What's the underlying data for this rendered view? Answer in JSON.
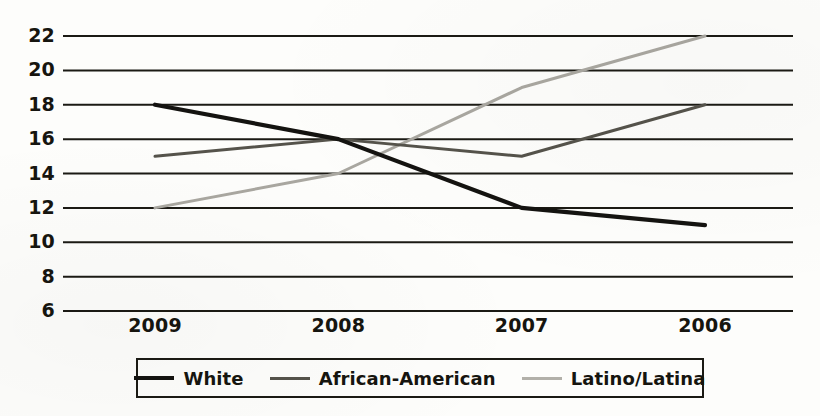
{
  "chart_data": {
    "type": "line",
    "title": "",
    "subtitle": "",
    "xlabel": "",
    "ylabel": "",
    "categories": [
      "2009",
      "2008",
      "2007",
      "2006"
    ],
    "x": [
      "2009",
      "2008",
      "2007",
      "2006"
    ],
    "series": [
      {
        "name": "White",
        "values": [
          18,
          16,
          12,
          11
        ],
        "color": "#141310",
        "width": 4.2
      },
      {
        "name": "African-American",
        "values": [
          15,
          16,
          15,
          18
        ],
        "color": "#55534b",
        "width": 3.0
      },
      {
        "name": "Latino/Latina",
        "values": [
          12,
          14,
          19,
          22
        ],
        "color": "#a9a7a0",
        "width": 3.0
      }
    ],
    "ylim": [
      6,
      22
    ],
    "ytick_labels": [
      "22",
      "20",
      "18",
      "16",
      "14",
      "12",
      "10",
      "8",
      "6"
    ],
    "ytick_values": [
      22,
      20,
      18,
      16,
      14,
      12,
      10,
      8,
      6
    ],
    "grid": "horizontal",
    "grid_color": "#1b1a14",
    "legend_position": "bottom",
    "background": "#fdfdfb"
  },
  "legend": {
    "items": [
      {
        "label": "White",
        "color": "#141310",
        "thickness": "4px"
      },
      {
        "label": "African-American",
        "color": "#55534b",
        "thickness": "3px"
      },
      {
        "label": "Latino/Latina",
        "color": "#b2b0a9",
        "thickness": "3px"
      }
    ]
  }
}
